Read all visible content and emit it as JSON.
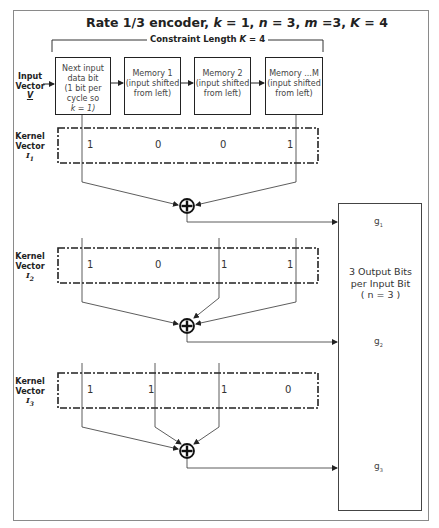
{
  "title": {
    "prefix": "Rate 1/3 encoder, ",
    "k_label": "k",
    "k_value": " = 1, ",
    "n_label": "n",
    "n_value": " = 3, ",
    "m_label": "m",
    "m_value": " =3, ",
    "K_label": "K",
    "K_value": " = 4"
  },
  "constraint": {
    "prefix": "Constraint Length ",
    "K_label": "K",
    "value": " = 4"
  },
  "input_vector": {
    "line1": "Input",
    "line2": "Vector",
    "symbol": "V"
  },
  "registers": [
    {
      "lines": [
        "Next input",
        "data bit",
        "(1 bit per",
        "cycle so",
        "k = 1)"
      ]
    },
    {
      "lines": [
        "Memory 1",
        "(input shifted",
        "from left)"
      ]
    },
    {
      "lines": [
        "Memory 2",
        "(input shifted",
        "from left)"
      ]
    },
    {
      "lines": [
        "Memory ...M",
        "(input shifted",
        "from left)"
      ]
    }
  ],
  "kernels": [
    {
      "label1": "Kernel",
      "label2": "Vector",
      "symbol": "I",
      "sub": "1",
      "values": [
        "1",
        "0",
        "0",
        "1"
      ]
    },
    {
      "label1": "Kernel",
      "label2": "Vector",
      "symbol": "I",
      "sub": "2",
      "values": [
        "1",
        "0",
        "1",
        "1"
      ]
    },
    {
      "label1": "Kernel",
      "label2": "Vector",
      "symbol": "I",
      "sub": "3",
      "values": [
        "1",
        "1",
        "1",
        "0"
      ]
    }
  ],
  "xor_symbol": "⊕",
  "output": {
    "line1": "3 Output Bits",
    "line2": "per Input Bit",
    "line3": "( n = 3 )",
    "g": [
      {
        "base": "g",
        "sub": "1"
      },
      {
        "base": "g",
        "sub": "2"
      },
      {
        "base": "g",
        "sub": "3"
      }
    ]
  },
  "colors": {
    "line": "#222222",
    "frame": "#8a8a8a",
    "text": "#333333"
  }
}
